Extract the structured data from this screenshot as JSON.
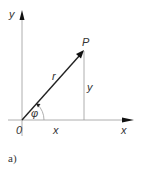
{
  "diagram": {
    "type": "polar-coordinates",
    "labels": {
      "y_axis": "y",
      "x_axis": "x",
      "origin": "0",
      "point": "P",
      "radius": "r",
      "angle": "φ",
      "x_projection": "x",
      "y_projection": "y"
    },
    "caption": "a)",
    "colors": {
      "axis": "#9a9a9a",
      "vector": "#222222",
      "text": "#333333"
    }
  }
}
